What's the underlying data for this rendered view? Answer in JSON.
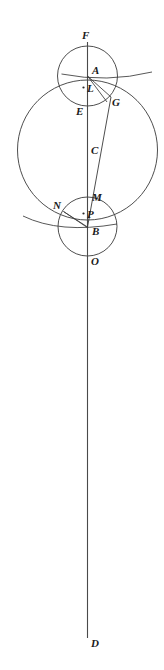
{
  "figure": {
    "background_color": "#ffffff",
    "stroke_color": "#3a3a3a",
    "label_color": "#1a1a1a",
    "width": 164,
    "height": 670
  },
  "axis": {
    "name": "vertical-line-FD",
    "x": 87.5,
    "y_top": 42,
    "y_bottom": 638,
    "endpoint_top_label": "F",
    "endpoint_bottom_label": "D"
  },
  "circles": [
    {
      "name": "upper-small-circle",
      "cx": 87.5,
      "cy": 76,
      "r": 30,
      "top_point": "F",
      "bottom_point": "E",
      "center_point": "L"
    },
    {
      "name": "large-circle",
      "cx": 87.5,
      "cy": 150,
      "r": 70,
      "top_point": "A",
      "bottom_point": "B",
      "center_point": "C"
    },
    {
      "name": "lower-small-circle",
      "cx": 87.5,
      "cy": 226.5,
      "r": 29.5,
      "top_point": "M",
      "bottom_point": "O",
      "center_point": "P"
    }
  ],
  "chords": [
    {
      "name": "chord-A-G",
      "x1": 87.5,
      "y1": 76,
      "x2": 111,
      "y2": 97
    },
    {
      "name": "chord-A-arc-lower",
      "x1": 87.5,
      "y1": 76,
      "x2": 108,
      "y2": 101
    },
    {
      "name": "secant-G-to-B",
      "x1": 111,
      "y1": 97,
      "x2": 87.5,
      "y2": 227
    },
    {
      "name": "chord-N-B",
      "x1": 64,
      "y1": 212,
      "x2": 87.5,
      "y2": 227
    },
    {
      "name": "chord-N-P-B",
      "x1": 64,
      "y1": 212,
      "x2": 87.5,
      "y2": 227
    }
  ],
  "horizontal_chords": [
    {
      "name": "chord-through-A",
      "y": 76,
      "x1": 61,
      "x2": 152
    },
    {
      "name": "chord-through-B",
      "y": 227,
      "x1": 23,
      "x2": 117
    }
  ],
  "center_dots": [
    {
      "name": "center-dot-L",
      "label": "L",
      "cx": 84,
      "cy": 88
    },
    {
      "name": "center-dot-P",
      "label": "P",
      "cx": 84,
      "cy": 214
    }
  ],
  "labels": [
    {
      "name": "label-F",
      "text": "F",
      "x": 82,
      "y": 30
    },
    {
      "name": "label-A",
      "text": "A",
      "x": 92,
      "y": 65
    },
    {
      "name": "label-L",
      "text": "L",
      "x": 87,
      "y": 83
    },
    {
      "name": "label-G",
      "text": "G",
      "x": 112,
      "y": 97
    },
    {
      "name": "label-E",
      "text": "E",
      "x": 76,
      "y": 106
    },
    {
      "name": "label-C",
      "text": "C",
      "x": 91,
      "y": 145
    },
    {
      "name": "label-N",
      "text": "N",
      "x": 53,
      "y": 200
    },
    {
      "name": "label-M",
      "text": "M",
      "x": 92,
      "y": 192
    },
    {
      "name": "label-P",
      "text": "P",
      "x": 87,
      "y": 209
    },
    {
      "name": "label-B",
      "text": "B",
      "x": 92,
      "y": 226
    },
    {
      "name": "label-O",
      "text": "O",
      "x": 91,
      "y": 256
    },
    {
      "name": "label-D",
      "text": "D",
      "x": 91,
      "y": 638
    }
  ]
}
